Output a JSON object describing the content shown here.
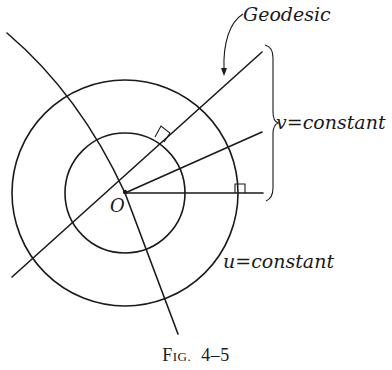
{
  "figure": {
    "caption": {
      "prefix_big": "F",
      "prefix_small": "IG.",
      "number": "4–5"
    },
    "labels": {
      "geodesic": "Geodesic",
      "v_constant": "v=constant",
      "u_constant": "u=constant",
      "origin": "O"
    },
    "geometry": {
      "origin": [
        125,
        193
      ],
      "inner_circle_radius": 60,
      "outer_circle_radius": 113
    },
    "colors": {
      "ink": "#1a1a1a",
      "background": "#ffffff"
    }
  }
}
